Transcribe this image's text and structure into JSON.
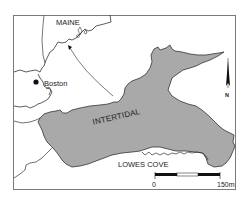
{
  "map": {
    "labels": {
      "state": "MAINE",
      "city": "Boston",
      "zone": "INTERTIDAL",
      "cove": "LOWES COVE"
    },
    "north_arrow": {
      "label": "N"
    },
    "scale_bar": {
      "start_label": "0",
      "end_label": "150m"
    },
    "colors": {
      "frame": "#7a7a7a",
      "intertidal_fill": "#a9a9a9",
      "coastline": "#333333",
      "background": "#ffffff"
    },
    "icons": {
      "city_marker": "filled-circle",
      "locator_arrow": "curved-arrow",
      "north_arrow": "north-arrow"
    }
  }
}
